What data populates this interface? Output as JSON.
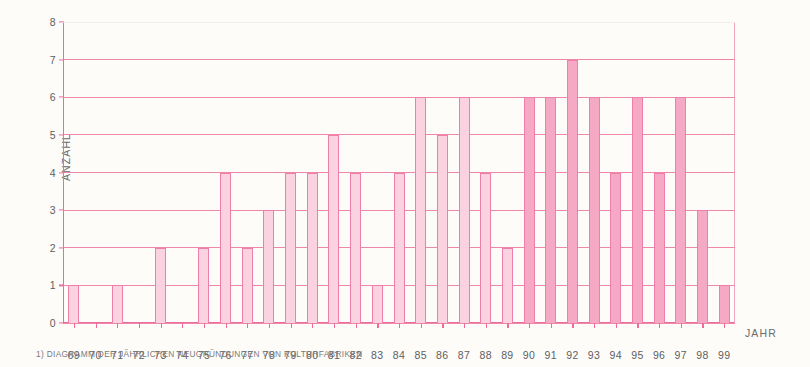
{
  "chart_data": {
    "type": "bar",
    "title": "",
    "subtitle": "",
    "xlabel": "JAHR",
    "ylabel": "ANZAHL",
    "ylim": [
      0,
      8
    ],
    "yticks": [
      0,
      1,
      2,
      3,
      4,
      5,
      6,
      7,
      8
    ],
    "grid": true,
    "legend": null,
    "categories": [
      "69",
      "70",
      "71",
      "72",
      "73",
      "74",
      "75",
      "76",
      "77",
      "78",
      "79",
      "80",
      "81",
      "82",
      "83",
      "84",
      "85",
      "86",
      "87",
      "88",
      "89",
      "90",
      "91",
      "92",
      "93",
      "94",
      "95",
      "96",
      "97",
      "98",
      "99"
    ],
    "values": [
      1,
      0,
      1,
      0,
      2,
      0,
      2,
      4,
      2,
      3,
      4,
      4,
      5,
      4,
      1,
      4,
      6,
      5,
      6,
      4,
      2,
      6,
      6,
      7,
      6,
      4,
      6,
      4,
      6,
      3,
      1
    ],
    "bar_shading": [
      "light",
      "light",
      "light",
      "light",
      "light",
      "light",
      "light",
      "light",
      "light",
      "light",
      "light",
      "light",
      "light",
      "light",
      "light",
      "light",
      "light",
      "light",
      "light",
      "light",
      "light",
      "dark",
      "dark",
      "dark",
      "dark",
      "dark",
      "dark",
      "dark",
      "dark",
      "dark",
      "dark"
    ],
    "annotation": "1) DIAGRAMM DER JÄHRLICHEN NEUGRÜNDUNGEN VON KULTURFABRIKEN"
  },
  "colors": {
    "background": "#fdfcf9",
    "bar_fill_light": "#fbd3e0",
    "bar_fill_dark": "#f5a9c4",
    "bar_edge": "#ef7fa9",
    "gridline": "#ef87ad",
    "axis": "#ea6d9c",
    "tick_text": "#5e5e5e",
    "caption_text": "#7a7a7a"
  }
}
